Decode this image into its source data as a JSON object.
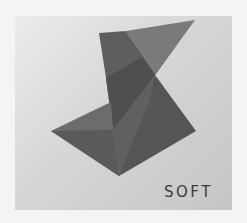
{
  "logo": {
    "brand_text": "SOFT",
    "colors": {
      "background": "#f4f4f4",
      "panel_light": "#ececec",
      "panel_dark": "#c6c6c6",
      "shape_light": "#7d7d7d",
      "shape_mid": "#636363",
      "shape_dark": "#4e4e4e",
      "text": "#3a3a3a"
    }
  }
}
